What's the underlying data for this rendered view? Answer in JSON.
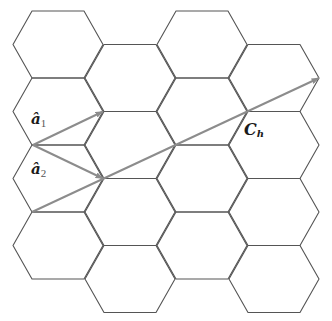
{
  "diagram": {
    "type": "graphene-honeycomb-lattice",
    "colors": {
      "lattice_stroke": "#555555",
      "vector_stroke": "#8c8c8c",
      "label": "#1a1a1a"
    },
    "hexagon": {
      "outer_half_width": 45,
      "inner_half_width": 26,
      "half_height": 33.5
    },
    "columns": [
      {
        "cx": 58,
        "cy": [
          44.5,
          111.5,
          178.5,
          245.5
        ]
      },
      {
        "cx": 130,
        "cy": [
          78,
          145,
          212,
          279
        ]
      },
      {
        "cx": 202,
        "cy": [
          44.5,
          111.5,
          178.5,
          245.5
        ]
      },
      {
        "cx": 274,
        "cy": [
          78,
          145,
          212,
          279
        ]
      }
    ],
    "vectors": [
      {
        "id": "a1",
        "from": [
          33,
          145
        ],
        "to": [
          103,
          111.5
        ]
      },
      {
        "id": "a2",
        "from": [
          33,
          145
        ],
        "to": [
          103,
          178.5
        ]
      },
      {
        "id": "Ch",
        "from": [
          32,
          212
        ],
        "to": [
          319,
          78
        ]
      }
    ],
    "labels": {
      "a1": {
        "main": "â",
        "sub": "1",
        "x": 31,
        "y": 124
      },
      "a2": {
        "main": "â",
        "sub": "2",
        "x": 31,
        "y": 174
      },
      "Ch": {
        "main": "C",
        "sub": "h",
        "x": 244,
        "y": 135
      }
    }
  }
}
